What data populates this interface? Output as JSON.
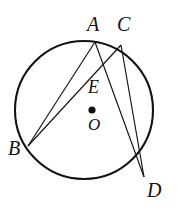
{
  "figure": {
    "kind": "circle-with-inscribed-chords",
    "background_color": "#ffffff",
    "stroke_color": "#121212",
    "circle": {
      "center_x": 84,
      "center_y": 110,
      "radius": 69,
      "stroke_width": 2.1
    },
    "center_dot": {
      "x": 92,
      "y": 110,
      "radius": 3.6,
      "fill": "#121212"
    },
    "points": {
      "A": {
        "x": 95,
        "y": 42
      },
      "C": {
        "x": 121,
        "y": 45
      },
      "B": {
        "x": 28,
        "y": 146
      },
      "D": {
        "x": 144,
        "y": 177
      },
      "E": {
        "x": 101,
        "y": 69
      },
      "O": {
        "x": 92,
        "y": 110
      }
    },
    "chords": [
      {
        "name": "chord-AB",
        "from": "A",
        "to": "B"
      },
      {
        "name": "chord-AD",
        "from": "A",
        "to": "D"
      },
      {
        "name": "chord-CB",
        "from": "C",
        "to": "B"
      },
      {
        "name": "chord-CD",
        "from": "C",
        "to": "D"
      }
    ],
    "labels": {
      "A": "A",
      "C": "C",
      "B": "B",
      "D": "D",
      "E": "E",
      "O": "O"
    }
  }
}
